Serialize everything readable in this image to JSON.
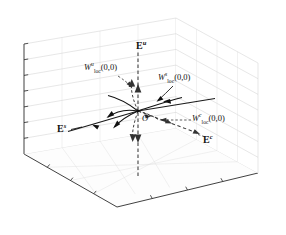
{
  "figure": {
    "background_color": "#ffffff",
    "axis_color": "#2b2b2b",
    "grid_color": "#c9c9c9",
    "manifold_color": "#111111"
  },
  "eigenspaces": [
    {
      "id": "unstable",
      "base": "E",
      "superscript": "u",
      "position": {
        "x": 138,
        "y": 45
      }
    },
    {
      "id": "stable",
      "base": "E",
      "superscript": "s",
      "position": {
        "x": 59,
        "y": 128
      }
    },
    {
      "id": "center",
      "base": "E",
      "superscript": "c",
      "position": {
        "x": 201,
        "y": 139
      }
    }
  ],
  "manifolds": [
    {
      "id": "unstable-manifold",
      "base": "W",
      "superscript": "u",
      "subscript": "loc",
      "argument": "(0,0)",
      "position": {
        "x": 86,
        "y": 66
      }
    },
    {
      "id": "stable-manifold",
      "base": "W",
      "superscript": "s",
      "subscript": "loc",
      "argument": "(0,0)",
      "position": {
        "x": 160,
        "y": 76
      }
    },
    {
      "id": "center-manifold",
      "base": "W",
      "superscript": "c",
      "subscript": "loc",
      "argument": "(0,0)",
      "position": {
        "x": 193,
        "y": 113
      }
    }
  ],
  "origin": {
    "label": "O",
    "position": {
      "x": 143,
      "y": 119
    }
  },
  "geometry": {
    "fixed_point": {
      "x": 138,
      "y": 111
    },
    "box": {
      "front_bottom": {
        "x": 117,
        "y": 207
      },
      "left_bottom": {
        "x": 24,
        "y": 154
      },
      "right_bottom": {
        "x": 258,
        "y": 173
      },
      "back_bottom": {
        "x": 176,
        "y": 128
      },
      "left_top": {
        "x": 24,
        "y": 44
      },
      "back_top": {
        "x": 176,
        "y": 18
      },
      "right_top": {
        "x": 258,
        "y": 63
      }
    },
    "grid_divisions_floor": 4,
    "grid_divisions_wall": 7
  }
}
